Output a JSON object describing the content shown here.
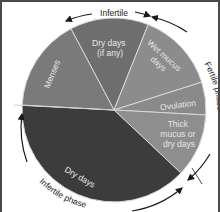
{
  "center": {
    "x": 112,
    "y": 108
  },
  "radius": 92,
  "chart_data": {
    "type": "pie",
    "title": "",
    "slices": [
      {
        "label": "Dry days (if any)",
        "lines": [
          "Dry days",
          "(if any)"
        ],
        "start_deg": -117.9,
        "end_deg": -68.2,
        "color": "#6e6e6e"
      },
      {
        "label": "Wet mucus days",
        "lines": [
          "Wet mucus",
          "days"
        ],
        "start_deg": -68.2,
        "end_deg": -17.6,
        "color": "#8c8c8c"
      },
      {
        "label": "Ovulation",
        "lines": [
          "Ovulation"
        ],
        "start_deg": -17.6,
        "end_deg": 3.1,
        "color": "#8a8a8a"
      },
      {
        "label": "Thick mucus or dry days",
        "lines": [
          "Thick",
          "mucus or",
          "dry days"
        ],
        "start_deg": 3.1,
        "end_deg": 43.3,
        "color": "#8e8e8e"
      },
      {
        "label": "Dry days",
        "lines": [
          "Dry days"
        ],
        "start_deg": 43.3,
        "end_deg": 183.1,
        "color": "#3c3c3c"
      },
      {
        "label": "Menses",
        "lines": [
          "Menses"
        ],
        "start_deg": 183.1,
        "end_deg": 242.1,
        "color": "#7a7a7a"
      }
    ],
    "annotations": [
      {
        "label": "Infertile",
        "position": "top arc"
      },
      {
        "label": "Fertile phase",
        "position": "right arc"
      },
      {
        "label": "Infertile phase",
        "position": "bottom-left arc"
      }
    ]
  },
  "labels": {
    "dry_if_any_1": "Dry days",
    "dry_if_any_2": "(if any)",
    "wet_1": "Wet mucus",
    "wet_2": "days",
    "ovulation": "Ovulation",
    "thick_1": "Thick",
    "thick_2": "mucus or",
    "thick_3": "dry days",
    "dry_days": "Dry days",
    "menses": "Menses",
    "infertile_top": "Infertile",
    "fertile_phase": "Fertile phase",
    "infertile_phase": "Infertile phase"
  }
}
